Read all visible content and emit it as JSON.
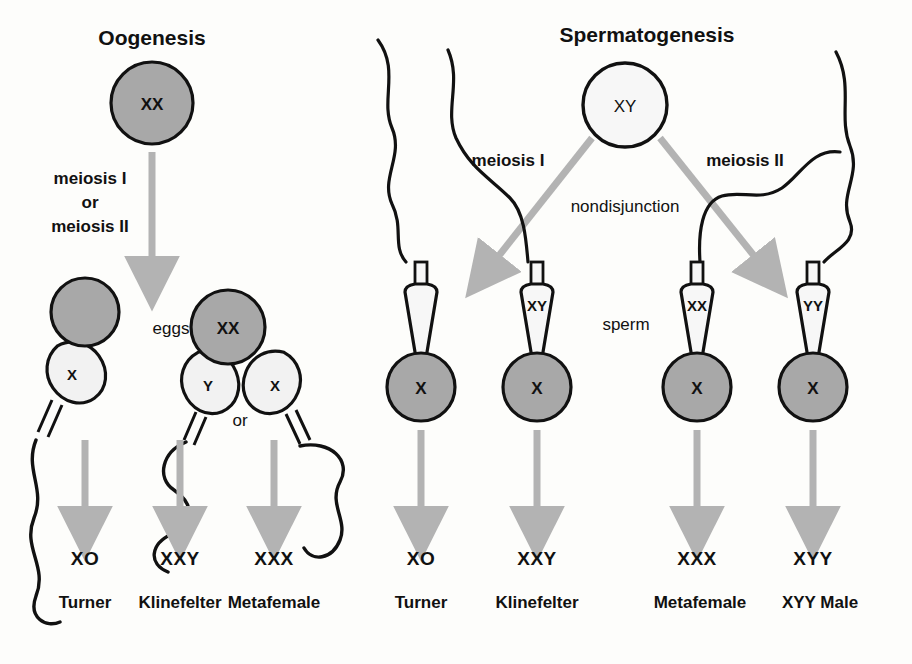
{
  "figure": {
    "background": "#fdfdfb",
    "colors": {
      "egg_fill": "#a8a8a8",
      "gamete_light_fill": "#f2f2f2",
      "outline": "#111111",
      "arrow_gray": "#b3b3b3",
      "text": "#111111"
    }
  },
  "headings": {
    "oogenesis": "Oogenesis",
    "spermatogenesis": "Spermatogenesis"
  },
  "labels": {
    "eggs": "eggs",
    "sperm": "sperm",
    "or": "or",
    "nondisjunction": "nondisjunction"
  },
  "oogenesis": {
    "parent_cell": {
      "label": "XX",
      "fill": "#a8a8a8"
    },
    "meiosis_note_lines": [
      "meiosis I",
      "or",
      "meiosis II"
    ],
    "fertilizations": [
      {
        "egg": {
          "label": "",
          "fill": "#a8a8a8"
        },
        "sperm": [
          {
            "label": "X"
          }
        ],
        "karyotype": "XO",
        "syndrome": "Turner"
      },
      {
        "egg": {
          "label": "XX",
          "fill": "#a8a8a8"
        },
        "sperm": [
          {
            "label": "Y"
          },
          {
            "label": "X"
          }
        ],
        "karyotype_left": "XXY",
        "syndrome_left": "Klinefelter",
        "karyotype_right": "XXX",
        "syndrome_right": "Metafemale"
      }
    ],
    "outcomes": [
      {
        "karyotype": "XO",
        "syndrome": "Turner"
      },
      {
        "karyotype": "XXY",
        "syndrome": "Klinefelter"
      },
      {
        "karyotype": "XXX",
        "syndrome": "Metafemale"
      }
    ]
  },
  "spermatogenesis": {
    "parent_cell": {
      "label": "XY",
      "fill": "#f2f2f2"
    },
    "meiosis_left": "meiosis I",
    "meiosis_right": "meiosis II",
    "fertilizations": [
      {
        "sperm": {
          "label": ""
        },
        "egg": {
          "label": "X"
        }
      },
      {
        "sperm": {
          "label": "XY"
        },
        "egg": {
          "label": "X"
        }
      },
      {
        "sperm": {
          "label": "XX"
        },
        "egg": {
          "label": "X"
        }
      },
      {
        "sperm": {
          "label": "YY"
        },
        "egg": {
          "label": "X"
        }
      }
    ],
    "outcomes": [
      {
        "karyotype": "XO",
        "syndrome": "Turner"
      },
      {
        "karyotype": "XXY",
        "syndrome": "Klinefelter"
      },
      {
        "karyotype": "XXX",
        "syndrome": "Metafemale"
      },
      {
        "karyotype": "XYY",
        "syndrome": "XYY Male"
      }
    ]
  }
}
